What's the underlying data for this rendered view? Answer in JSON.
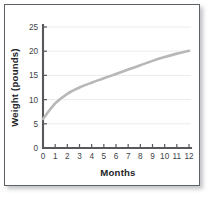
{
  "chart_data": {
    "type": "line",
    "title": "",
    "xlabel": "Months",
    "ylabel": "Weight (pounds)",
    "xlim": [
      0,
      12
    ],
    "ylim": [
      0,
      25
    ],
    "grid": true,
    "legend": "none",
    "x_ticks": [
      "0",
      "1",
      "2",
      "3",
      "4",
      "5",
      "6",
      "7",
      "8",
      "9",
      "10",
      "11",
      "12"
    ],
    "y_ticks": [
      "0",
      "5",
      "10",
      "15",
      "20",
      "25"
    ],
    "x": [
      0,
      1,
      2,
      3,
      4,
      5,
      6,
      7,
      8,
      9,
      10,
      11,
      12
    ],
    "series": [
      {
        "name": "Weight",
        "color": "#b7b7b7",
        "values": [
          6.0,
          9.2,
          11.2,
          12.5,
          13.5,
          14.4,
          15.3,
          16.2,
          17.1,
          18.0,
          18.8,
          19.5,
          20.1
        ]
      }
    ]
  },
  "figure": {
    "border_color": "#5d6268",
    "axis_color": "#56585b",
    "gridline_color": "#ececec",
    "background": "#ffffff"
  }
}
